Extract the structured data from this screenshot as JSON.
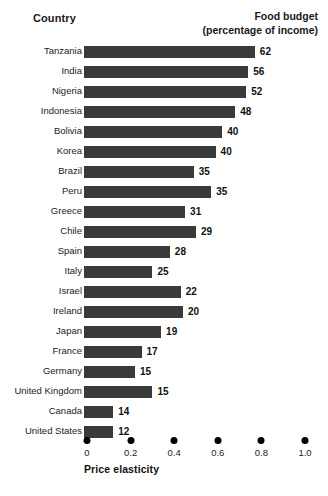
{
  "header": {
    "country_label": "Country",
    "value_title_line1": "Food budget",
    "value_title_line2": "(percentage of income)"
  },
  "axis": {
    "title": "Price elasticity",
    "ticks": [
      "0",
      "0.2",
      "0.4",
      "0.6",
      "0.8",
      "1.0"
    ]
  },
  "chart_data": {
    "type": "bar",
    "orientation": "horizontal",
    "title": "Food budget (percentage of income)",
    "xlabel": "Price elasticity",
    "ylabel": "Country",
    "xlim": [
      0,
      1.0
    ],
    "xticks": [
      0,
      0.2,
      0.4,
      0.6,
      0.8,
      1.0
    ],
    "grid": false,
    "legend": "none",
    "bar_color": "#3a3a3a",
    "note": "Bar length encodes price elasticity (bottom axis); the printed number at the end of each bar is the food budget as a percentage of income.",
    "categories": [
      "Tanzania",
      "India",
      "Nigeria",
      "Indonesia",
      "Bolivia",
      "Korea",
      "Brazil",
      "Peru",
      "Greece",
      "Chile",
      "Spain",
      "Italy",
      "Israel",
      "Ireland",
      "Japan",
      "France",
      "Germany",
      "United Kingdom",
      "Canada",
      "United States"
    ],
    "series": [
      {
        "name": "Price elasticity",
        "encoding": "bar-length",
        "values": [
          0.77,
          0.74,
          0.73,
          0.68,
          0.62,
          0.59,
          0.49,
          0.57,
          0.45,
          0.5,
          0.38,
          0.3,
          0.43,
          0.44,
          0.34,
          0.25,
          0.22,
          0.3,
          0.12,
          0.12
        ]
      },
      {
        "name": "Food budget (percentage of income)",
        "encoding": "data-label",
        "values": [
          62,
          56,
          52,
          48,
          40,
          40,
          35,
          35,
          31,
          29,
          28,
          25,
          22,
          20,
          19,
          17,
          15,
          15,
          14,
          12
        ]
      }
    ]
  }
}
